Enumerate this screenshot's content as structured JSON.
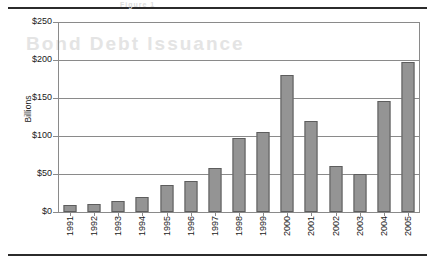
{
  "chart_data": {
    "type": "bar",
    "title": "",
    "xlabel": "",
    "ylabel": "Billions",
    "ylim": [
      0,
      250
    ],
    "ytick_labels": [
      "$250",
      "$200",
      "$150",
      "$100",
      "$50",
      "$0"
    ],
    "ytick_values": [
      250,
      200,
      150,
      100,
      50,
      0
    ],
    "grid": true,
    "legend": "none",
    "categories": [
      "1991",
      "1992",
      "1993",
      "1994",
      "1995",
      "1996",
      "1997",
      "1998",
      "1999",
      "2000",
      "2001",
      "2002",
      "2003",
      "2004",
      "2005"
    ],
    "values": [
      9,
      11,
      14,
      20,
      36,
      41,
      58,
      98,
      105,
      180,
      120,
      60,
      50,
      146,
      198
    ],
    "bar_color": "#949494",
    "bar_edge_color": "#5d5d5d",
    "grid_color": "#8a8a8a",
    "rule_color": "#2b2b2b"
  },
  "figure": {
    "top_rule": "horizontal-rule",
    "bottom_rule": "horizontal-rule",
    "ghost_text_1": "Bond Debt Issuance",
    "ghost_text_2": "Figure 1"
  }
}
